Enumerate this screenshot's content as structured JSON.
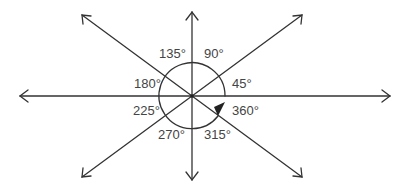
{
  "diagram": {
    "labels": {
      "a0": "45°",
      "a1": "90°",
      "a2": "135°",
      "a3": "180°",
      "a4": "225°",
      "a5": "270°",
      "a6": "315°",
      "a7": "360°"
    },
    "stroke_color": "#333333"
  }
}
